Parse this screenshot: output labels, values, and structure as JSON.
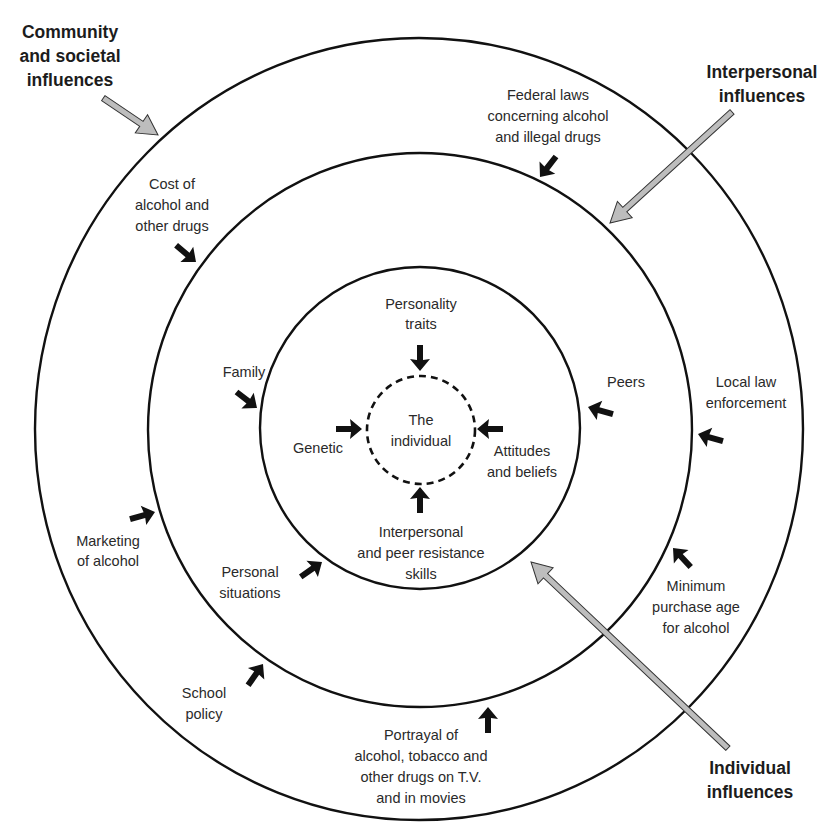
{
  "diagram": {
    "type": "concentric-circles",
    "center_label": [
      "The",
      "individual"
    ],
    "rings": [
      {
        "name": "Individual influences",
        "ring": "inner"
      },
      {
        "name": "Interpersonal influences",
        "ring": "middle"
      },
      {
        "name": "Community and societal influences",
        "ring": "outer"
      }
    ]
  },
  "headers": {
    "community": [
      "Community",
      "and societal",
      "influences"
    ],
    "interpersonal": [
      "Interpersonal",
      "influences"
    ],
    "individual": [
      "Individual",
      "influences"
    ]
  },
  "individual_factors": {
    "personality": [
      "Personality",
      "traits"
    ],
    "genetic": [
      "Genetic"
    ],
    "attitudes": [
      "Attitudes",
      "and beliefs"
    ],
    "resistance": [
      "Interpersonal",
      "and peer resistance",
      "skills"
    ]
  },
  "interpersonal_factors": {
    "family": [
      "Family"
    ],
    "peers": [
      "Peers"
    ],
    "personal_situations": [
      "Personal",
      "situations"
    ]
  },
  "community_factors": {
    "federal_laws": [
      "Federal laws",
      "concerning alcohol",
      "and illegal drugs"
    ],
    "cost": [
      "Cost of",
      "alcohol and",
      "other drugs"
    ],
    "local_law": [
      "Local law",
      "enforcement"
    ],
    "marketing": [
      "Marketing",
      "of alcohol"
    ],
    "minimum_age": [
      "Minimum",
      "purchase age",
      "for alcohol"
    ],
    "school_policy": [
      "School",
      "policy"
    ],
    "portrayal": [
      "Portrayal of",
      "alcohol, tobacco and",
      "other drugs on T.V.",
      "and in movies"
    ]
  },
  "colors": {
    "line": "#111111",
    "text": "#2a2a2a",
    "pointer_fill": "#bdbdbd",
    "background": "#ffffff"
  }
}
